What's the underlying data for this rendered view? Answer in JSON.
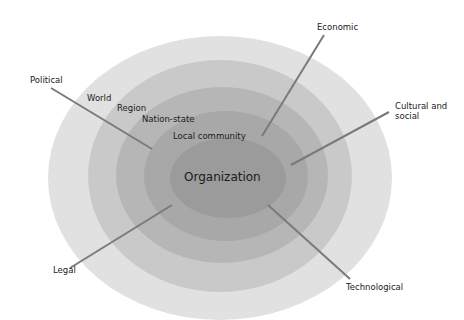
{
  "diagram": {
    "type": "concentric-environment-model",
    "center_label": "Organization",
    "levels": [
      {
        "label": "World",
        "fill": "#e1e1e1"
      },
      {
        "label": "Region",
        "fill": "#c9c9c9"
      },
      {
        "label": "Nation-state",
        "fill": "#b6b6b6"
      },
      {
        "label": "Local community",
        "fill": "#a6a6a6"
      },
      {
        "label": "Organization",
        "fill": "#9a9a9a"
      }
    ],
    "factors": [
      {
        "label": "Political"
      },
      {
        "label": "Economic"
      },
      {
        "label": "Cultural and\nsocial"
      },
      {
        "label": "Technological"
      },
      {
        "label": "Legal"
      }
    ],
    "line_color": "#7a7a7a",
    "text_color": "#1a1a1a"
  }
}
